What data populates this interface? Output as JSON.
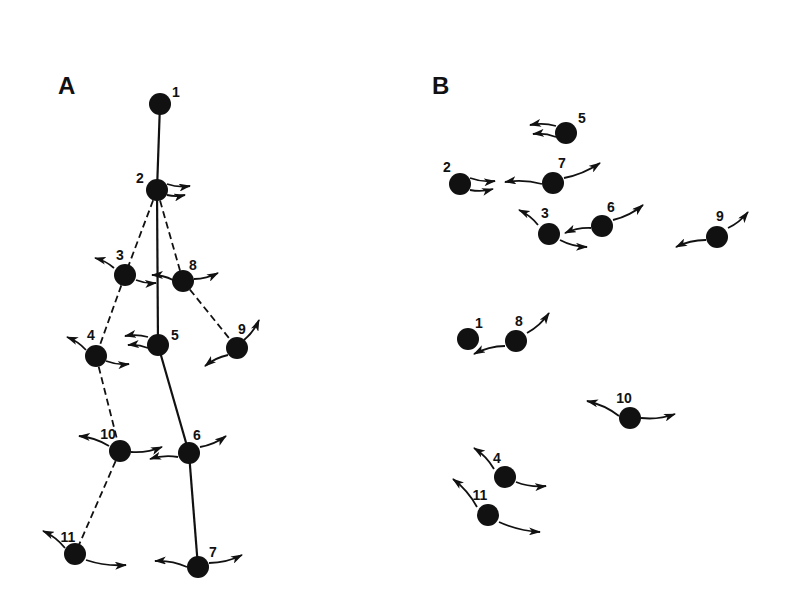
{
  "colors": {
    "ink": "#111111",
    "background": "#ffffff"
  },
  "panels": [
    {
      "id": "A",
      "label": "A",
      "label_pos": [
        58,
        72
      ],
      "nodes": [
        {
          "id": "1",
          "label": "1",
          "x": 160,
          "y": 104,
          "lx": 176,
          "ly": 92,
          "arrows": []
        },
        {
          "id": "2",
          "label": "2",
          "x": 157,
          "y": 190,
          "lx": 140,
          "ly": 178,
          "arrows": [
            [
              [
                167,
                184
              ],
              [
                190,
                186
              ]
            ],
            [
              [
                167,
                195
              ],
              [
                185,
                195
              ]
            ]
          ]
        },
        {
          "id": "3",
          "label": "3",
          "x": 125,
          "y": 275,
          "lx": 120,
          "ly": 255,
          "arrows": [
            [
              [
                114,
                268
              ],
              [
                95,
                258
              ]
            ],
            [
              [
                136,
                280
              ],
              [
                156,
                283
              ]
            ]
          ]
        },
        {
          "id": "8",
          "label": "8",
          "x": 183,
          "y": 281,
          "lx": 193,
          "ly": 265,
          "arrows": [
            [
              [
                173,
                280
              ],
              [
                152,
                275
              ]
            ],
            [
              [
                194,
                279
              ],
              [
                218,
                273
              ]
            ]
          ]
        },
        {
          "id": "4",
          "label": "4",
          "x": 96,
          "y": 356,
          "lx": 91,
          "ly": 335,
          "arrows": [
            [
              [
                86,
                350
              ],
              [
                67,
                337
              ]
            ],
            [
              [
                106,
                361
              ],
              [
                129,
                364
              ]
            ]
          ]
        },
        {
          "id": "5",
          "label": "5",
          "x": 158,
          "y": 345,
          "lx": 175,
          "ly": 335,
          "arrows": [
            [
              [
                148,
                337
              ],
              [
                125,
                336
              ]
            ],
            [
              [
                148,
                348
              ],
              [
                128,
                345
              ]
            ]
          ]
        },
        {
          "id": "9",
          "label": "9",
          "x": 237,
          "y": 348,
          "lx": 242,
          "ly": 329,
          "arrows": [
            [
              [
                244,
                340
              ],
              [
                259,
                320
              ]
            ],
            [
              [
                228,
                355
              ],
              [
                205,
                366
              ]
            ]
          ]
        },
        {
          "id": "10",
          "label": "10",
          "x": 120,
          "y": 451,
          "lx": 108,
          "ly": 434,
          "arrows": [
            [
              [
                109,
                446
              ],
              [
                79,
                436
              ]
            ],
            [
              [
                131,
                452
              ],
              [
                162,
                447
              ]
            ]
          ]
        },
        {
          "id": "6",
          "label": "6",
          "x": 189,
          "y": 453,
          "lx": 197,
          "ly": 435,
          "arrows": [
            [
              [
                178,
                457
              ],
              [
                150,
                459
              ]
            ],
            [
              [
                200,
                447
              ],
              [
                226,
                436
              ]
            ]
          ]
        },
        {
          "id": "11",
          "label": "11",
          "x": 75,
          "y": 554,
          "lx": 68,
          "ly": 537,
          "arrows": [
            [
              [
                65,
                548
              ],
              [
                43,
                531
              ]
            ],
            [
              [
                86,
                560
              ],
              [
                126,
                565
              ]
            ]
          ]
        },
        {
          "id": "7",
          "label": "7",
          "x": 198,
          "y": 567,
          "lx": 213,
          "ly": 552,
          "arrows": [
            [
              [
                187,
                567
              ],
              [
                155,
                561
              ]
            ],
            [
              [
                209,
                563
              ],
              [
                242,
                555
              ]
            ]
          ]
        }
      ],
      "edges": [
        {
          "from": "1",
          "to": "2",
          "style": "solid"
        },
        {
          "from": "2",
          "to": "3",
          "style": "dashed"
        },
        {
          "from": "2",
          "to": "5",
          "style": "solid"
        },
        {
          "from": "2",
          "to": "8",
          "style": "dashed"
        },
        {
          "from": "3",
          "to": "4",
          "style": "dashed"
        },
        {
          "from": "8",
          "to": "9",
          "style": "dashed"
        },
        {
          "from": "5",
          "to": "6",
          "style": "solid"
        },
        {
          "from": "4",
          "to": "10",
          "style": "dashed"
        },
        {
          "from": "10",
          "to": "11",
          "style": "dashed"
        },
        {
          "from": "6",
          "to": "7",
          "style": "solid"
        }
      ]
    },
    {
      "id": "B",
      "label": "B",
      "label_pos": [
        432,
        72
      ],
      "nodes": [
        {
          "id": "5",
          "label": "5",
          "x": 566,
          "y": 133,
          "lx": 582,
          "ly": 118,
          "arrows": [
            [
              [
                556,
                126
              ],
              [
                530,
                125
              ]
            ],
            [
              [
                556,
                137
              ],
              [
                533,
                134
              ]
            ]
          ]
        },
        {
          "id": "2",
          "label": "2",
          "x": 460,
          "y": 184,
          "lx": 447,
          "ly": 167,
          "arrows": [
            [
              [
                470,
                178
              ],
              [
                495,
                181
              ]
            ],
            [
              [
                470,
                190
              ],
              [
                493,
                189
              ]
            ]
          ]
        },
        {
          "id": "7",
          "label": "7",
          "x": 553,
          "y": 183,
          "lx": 562,
          "ly": 163,
          "arrows": [
            [
              [
                542,
                184
              ],
              [
                505,
                182
              ]
            ],
            [
              [
                564,
                178
              ],
              [
                600,
                163
              ]
            ]
          ]
        },
        {
          "id": "3",
          "label": "3",
          "x": 549,
          "y": 234,
          "lx": 545,
          "ly": 213,
          "arrows": [
            [
              [
                538,
                225
              ],
              [
                519,
                210
              ]
            ],
            [
              [
                560,
                240
              ],
              [
                587,
                247
              ]
            ]
          ]
        },
        {
          "id": "6",
          "label": "6",
          "x": 602,
          "y": 226,
          "lx": 611,
          "ly": 207,
          "arrows": [
            [
              [
                591,
                228
              ],
              [
                565,
                233
              ]
            ],
            [
              [
                613,
                220
              ],
              [
                643,
                205
              ]
            ]
          ]
        },
        {
          "id": "9",
          "label": "9",
          "x": 717,
          "y": 237,
          "lx": 720,
          "ly": 216,
          "arrows": [
            [
              [
                728,
                228
              ],
              [
                748,
                212
              ]
            ],
            [
              [
                706,
                240
              ],
              [
                676,
                247
              ]
            ]
          ]
        },
        {
          "id": "1",
          "label": "1",
          "x": 468,
          "y": 339,
          "lx": 479,
          "ly": 323,
          "arrows": []
        },
        {
          "id": "8",
          "label": "8",
          "x": 516,
          "y": 341,
          "lx": 519,
          "ly": 321,
          "arrows": [
            [
              [
                505,
                346
              ],
              [
                474,
                354
              ]
            ],
            [
              [
                527,
                333
              ],
              [
                549,
                313
              ]
            ]
          ]
        },
        {
          "id": "10",
          "label": "10",
          "x": 630,
          "y": 418,
          "lx": 624,
          "ly": 398,
          "arrows": [
            [
              [
                619,
                416
              ],
              [
                587,
                401
              ]
            ],
            [
              [
                641,
                418
              ],
              [
                675,
                414
              ]
            ]
          ]
        },
        {
          "id": "4",
          "label": "4",
          "x": 505,
          "y": 477,
          "lx": 497,
          "ly": 458,
          "arrows": [
            [
              [
                494,
                469
              ],
              [
                474,
                448
              ]
            ],
            [
              [
                516,
                482
              ],
              [
                546,
                486
              ]
            ]
          ]
        },
        {
          "id": "11",
          "label": "11",
          "x": 488,
          "y": 515,
          "lx": 480,
          "ly": 495,
          "arrows": [
            [
              [
                477,
                507
              ],
              [
                453,
                479
              ]
            ],
            [
              [
                499,
                522
              ],
              [
                540,
                532
              ]
            ]
          ]
        }
      ],
      "edges": []
    }
  ]
}
